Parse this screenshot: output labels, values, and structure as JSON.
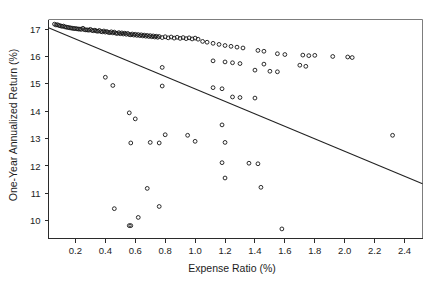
{
  "chart_data": {
    "type": "scatter",
    "title": "",
    "xlabel": "Expense Ratio (%)",
    "ylabel": "One-Year Annualized Return (%)",
    "xlim": [
      0.02,
      2.52
    ],
    "ylim": [
      9.35,
      17.35
    ],
    "xticks": [
      0.2,
      0.4,
      0.6,
      0.8,
      1.0,
      1.2,
      1.4,
      1.6,
      1.8,
      2.0,
      2.2,
      2.4
    ],
    "xtick_labels": [
      "0.2",
      "0.4",
      "0.6",
      "0.8",
      "1.0",
      "1.2",
      "1.4",
      "1.6",
      "1.8",
      "2.0",
      "2.2",
      "2.4"
    ],
    "yticks": [
      10,
      11,
      12,
      13,
      14,
      15,
      16,
      17
    ],
    "ytick_labels": [
      "10",
      "11",
      "12",
      "13",
      "14",
      "15",
      "16",
      "17"
    ],
    "grid": false,
    "legend": null,
    "marker": "open-circle",
    "marker_color": "#141414",
    "fit_line": {
      "label": "least-squares fit",
      "x0": 0.02,
      "y0": 17.05,
      "x1": 2.52,
      "y1": 11.35,
      "color": "#222222"
    },
    "points": [
      [
        0.06,
        17.18
      ],
      [
        0.07,
        17.15
      ],
      [
        0.08,
        17.16
      ],
      [
        0.09,
        17.13
      ],
      [
        0.1,
        17.12
      ],
      [
        0.11,
        17.1
      ],
      [
        0.12,
        17.11
      ],
      [
        0.13,
        17.08
      ],
      [
        0.14,
        17.07
      ],
      [
        0.15,
        17.06
      ],
      [
        0.16,
        17.05
      ],
      [
        0.17,
        17.04
      ],
      [
        0.18,
        17.03
      ],
      [
        0.19,
        17.02
      ],
      [
        0.2,
        17.02
      ],
      [
        0.21,
        17.01
      ],
      [
        0.22,
        17.0
      ],
      [
        0.23,
        17.0
      ],
      [
        0.24,
        16.99
      ],
      [
        0.25,
        17.03
      ],
      [
        0.26,
        16.98
      ],
      [
        0.27,
        16.97
      ],
      [
        0.28,
        16.97
      ],
      [
        0.29,
        16.96
      ],
      [
        0.3,
        16.99
      ],
      [
        0.31,
        16.95
      ],
      [
        0.32,
        16.94
      ],
      [
        0.33,
        16.96
      ],
      [
        0.34,
        16.93
      ],
      [
        0.35,
        16.92
      ],
      [
        0.36,
        16.95
      ],
      [
        0.37,
        16.91
      ],
      [
        0.38,
        16.9
      ],
      [
        0.39,
        16.93
      ],
      [
        0.4,
        16.89
      ],
      [
        0.41,
        16.91
      ],
      [
        0.42,
        16.88
      ],
      [
        0.43,
        16.87
      ],
      [
        0.44,
        16.9
      ],
      [
        0.45,
        16.86
      ],
      [
        0.46,
        16.89
      ],
      [
        0.47,
        16.85
      ],
      [
        0.48,
        16.84
      ],
      [
        0.49,
        16.87
      ],
      [
        0.5,
        16.83
      ],
      [
        0.51,
        16.86
      ],
      [
        0.52,
        16.82
      ],
      [
        0.53,
        16.85
      ],
      [
        0.54,
        16.81
      ],
      [
        0.55,
        16.84
      ],
      [
        0.56,
        16.8
      ],
      [
        0.57,
        16.79
      ],
      [
        0.58,
        16.82
      ],
      [
        0.59,
        16.78
      ],
      [
        0.6,
        16.81
      ],
      [
        0.61,
        16.77
      ],
      [
        0.62,
        16.8
      ],
      [
        0.63,
        16.76
      ],
      [
        0.64,
        16.79
      ],
      [
        0.65,
        16.75
      ],
      [
        0.66,
        16.78
      ],
      [
        0.67,
        16.74
      ],
      [
        0.68,
        16.77
      ],
      [
        0.69,
        16.73
      ],
      [
        0.7,
        16.76
      ],
      [
        0.71,
        16.72
      ],
      [
        0.72,
        16.75
      ],
      [
        0.73,
        16.71
      ],
      [
        0.74,
        16.74
      ],
      [
        0.75,
        16.7
      ],
      [
        0.76,
        16.73
      ],
      [
        0.78,
        16.69
      ],
      [
        0.8,
        16.72
      ],
      [
        0.82,
        16.68
      ],
      [
        0.84,
        16.71
      ],
      [
        0.86,
        16.67
      ],
      [
        0.88,
        16.7
      ],
      [
        0.9,
        16.66
      ],
      [
        0.92,
        16.69
      ],
      [
        0.94,
        16.65
      ],
      [
        0.96,
        16.68
      ],
      [
        0.98,
        16.64
      ],
      [
        1.0,
        16.67
      ],
      [
        1.02,
        16.63
      ],
      [
        1.05,
        16.55
      ],
      [
        1.08,
        16.52
      ],
      [
        1.12,
        16.48
      ],
      [
        1.16,
        16.44
      ],
      [
        1.2,
        16.4
      ],
      [
        1.24,
        16.37
      ],
      [
        1.28,
        16.34
      ],
      [
        1.32,
        16.31
      ],
      [
        1.42,
        16.22
      ],
      [
        1.46,
        16.19
      ],
      [
        1.55,
        16.1
      ],
      [
        1.6,
        16.07
      ],
      [
        1.72,
        16.05
      ],
      [
        1.76,
        16.03
      ],
      [
        1.8,
        16.04
      ],
      [
        1.92,
        16.0
      ],
      [
        2.02,
        15.98
      ],
      [
        2.05,
        15.96
      ],
      [
        1.46,
        15.72
      ],
      [
        1.7,
        15.68
      ],
      [
        1.74,
        15.64
      ],
      [
        1.12,
        15.84
      ],
      [
        1.2,
        15.8
      ],
      [
        1.25,
        15.77
      ],
      [
        1.3,
        15.74
      ],
      [
        1.4,
        15.5
      ],
      [
        1.5,
        15.46
      ],
      [
        1.55,
        15.44
      ],
      [
        0.4,
        15.24
      ],
      [
        0.78,
        15.6
      ],
      [
        0.45,
        14.94
      ],
      [
        0.78,
        14.92
      ],
      [
        1.12,
        14.86
      ],
      [
        1.18,
        14.82
      ],
      [
        1.25,
        14.52
      ],
      [
        1.3,
        14.5
      ],
      [
        1.4,
        14.48
      ],
      [
        0.56,
        13.94
      ],
      [
        0.6,
        13.72
      ],
      [
        1.18,
        13.5
      ],
      [
        0.8,
        13.14
      ],
      [
        0.95,
        13.12
      ],
      [
        1.0,
        12.9
      ],
      [
        0.57,
        12.84
      ],
      [
        0.7,
        12.86
      ],
      [
        0.76,
        12.84
      ],
      [
        1.2,
        12.86
      ],
      [
        2.32,
        13.12
      ],
      [
        1.18,
        12.12
      ],
      [
        1.36,
        12.1
      ],
      [
        1.42,
        12.08
      ],
      [
        0.68,
        11.18
      ],
      [
        1.2,
        11.56
      ],
      [
        0.46,
        10.44
      ],
      [
        0.76,
        10.52
      ],
      [
        1.44,
        11.22
      ],
      [
        0.62,
        10.12
      ],
      [
        0.56,
        9.82
      ],
      [
        0.57,
        9.82
      ],
      [
        1.58,
        9.7
      ]
    ]
  }
}
